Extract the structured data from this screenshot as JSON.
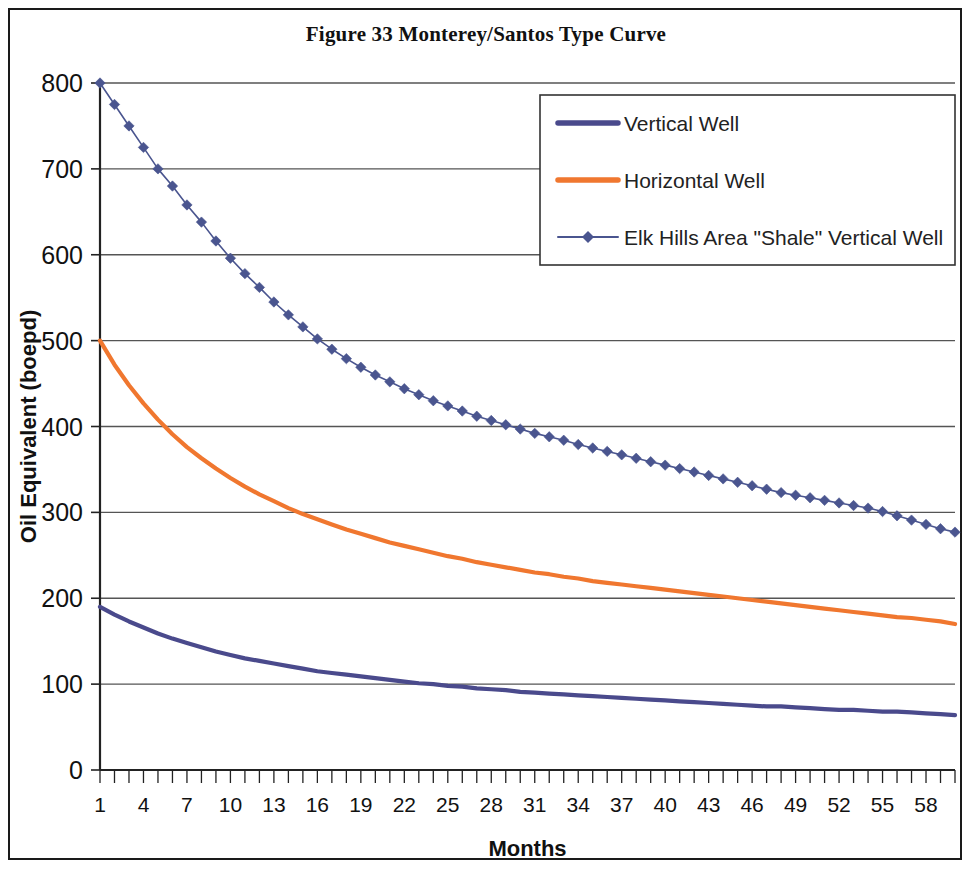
{
  "figure": {
    "title": "Figure 33 Monterey/Santos Type Curve",
    "border_color": "#1a1a1a",
    "background": "#ffffff"
  },
  "axes": {
    "x_title": "Months",
    "y_title": "Oil Equivalent (boepd)",
    "y_ticks": [
      "800",
      "700",
      "600",
      "500",
      "400",
      "300",
      "200",
      "100",
      "0"
    ],
    "x_ticks": [
      "1",
      "4",
      "7",
      "10",
      "13",
      "16",
      "19",
      "22",
      "25",
      "28",
      "31",
      "34",
      "37",
      "40",
      "43",
      "46",
      "49",
      "52",
      "55",
      "58"
    ]
  },
  "legend": {
    "items": [
      {
        "label": "Vertical Well",
        "color": "#4A4A8C",
        "marker": "none"
      },
      {
        "label": "Horizontal Well",
        "color": "#F0772F",
        "marker": "none"
      },
      {
        "label": "Elk Hills Area \"Shale\" Vertical Well",
        "color": "#4A558F",
        "marker": "diamond"
      }
    ]
  },
  "chart_data": {
    "type": "line",
    "title": "Figure 33 Monterey/Santos Type Curve",
    "xlabel": "Months",
    "ylabel": "Oil Equivalent (boepd)",
    "xlim": [
      1,
      60
    ],
    "ylim": [
      0,
      800
    ],
    "grid": "horizontal",
    "legend_position": "top-right",
    "x": [
      1,
      2,
      3,
      4,
      5,
      6,
      7,
      8,
      9,
      10,
      11,
      12,
      13,
      14,
      15,
      16,
      17,
      18,
      19,
      20,
      21,
      22,
      23,
      24,
      25,
      26,
      27,
      28,
      29,
      30,
      31,
      32,
      33,
      34,
      35,
      36,
      37,
      38,
      39,
      40,
      41,
      42,
      43,
      44,
      45,
      46,
      47,
      48,
      49,
      50,
      51,
      52,
      53,
      54,
      55,
      56,
      57,
      58,
      59,
      60
    ],
    "series": [
      {
        "name": "Vertical Well",
        "color": "#4A4A8C",
        "marker": "none",
        "values": [
          190,
          181,
          173,
          166,
          159,
          153,
          148,
          143,
          138,
          134,
          130,
          127,
          124,
          121,
          118,
          115,
          113,
          111,
          109,
          107,
          105,
          103,
          101,
          100,
          98,
          97,
          95,
          94,
          93,
          91,
          90,
          89,
          88,
          87,
          86,
          85,
          84,
          83,
          82,
          81,
          80,
          79,
          78,
          77,
          76,
          75,
          74,
          74,
          73,
          72,
          71,
          70,
          70,
          69,
          68,
          68,
          67,
          66,
          65,
          64
        ]
      },
      {
        "name": "Horizontal Well",
        "color": "#F0772F",
        "marker": "none",
        "values": [
          500,
          472,
          448,
          427,
          408,
          391,
          376,
          363,
          351,
          340,
          330,
          321,
          313,
          305,
          298,
          292,
          286,
          280,
          275,
          270,
          265,
          261,
          257,
          253,
          249,
          246,
          242,
          239,
          236,
          233,
          230,
          228,
          225,
          223,
          220,
          218,
          216,
          214,
          212,
          210,
          208,
          206,
          204,
          202,
          200,
          198,
          196,
          194,
          192,
          190,
          188,
          186,
          184,
          182,
          180,
          178,
          177,
          175,
          173,
          170
        ]
      },
      {
        "name": "Elk Hills Area \"Shale\" Vertical Well",
        "color": "#4A558F",
        "marker": "diamond",
        "values": [
          800,
          775,
          750,
          725,
          700,
          680,
          658,
          638,
          616,
          596,
          578,
          562,
          545,
          530,
          516,
          502,
          490,
          479,
          469,
          460,
          452,
          444,
          437,
          430,
          424,
          418,
          412,
          407,
          402,
          397,
          392,
          388,
          384,
          379,
          375,
          371,
          367,
          363,
          359,
          355,
          351,
          347,
          343,
          339,
          335,
          331,
          327,
          323,
          320,
          317,
          314,
          311,
          308,
          305,
          301,
          296,
          291,
          286,
          281,
          277
        ]
      }
    ]
  }
}
